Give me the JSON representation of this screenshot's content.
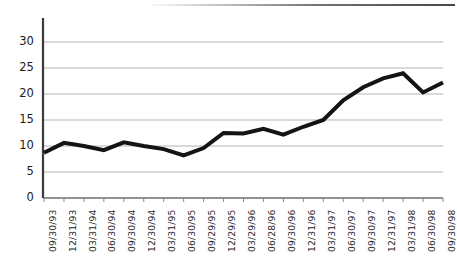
{
  "chart_data": {
    "type": "line",
    "title": "",
    "subtitle": "",
    "xlabel": "",
    "ylabel": "",
    "grid": true,
    "legend": "none",
    "xlim_index": [
      0,
      20
    ],
    "ylim": [
      0,
      33
    ],
    "yticks": [
      0,
      5,
      10,
      15,
      20,
      25,
      30
    ],
    "ytick_labels": [
      "0",
      "5",
      "10",
      "15",
      "20",
      "25",
      "30"
    ],
    "categories": [
      "09/30/93",
      "12/31/93",
      "03/31/94",
      "06/30/94",
      "09/30/94",
      "12/30/94",
      "03/31/95",
      "06/30/95",
      "09/29/95",
      "12/29/95",
      "03/29/96",
      "06/28/96",
      "09/30/96",
      "12/31/96",
      "03/31/97",
      "06/30/97",
      "09/30/97",
      "12/31/97",
      "03/31/98",
      "06/30/98",
      "09/30/98"
    ],
    "values": [
      8.7,
      10.6,
      10.0,
      9.2,
      10.7,
      10.0,
      9.4,
      8.2,
      9.6,
      12.5,
      12.4,
      13.3,
      12.2,
      13.7,
      15.0,
      18.8,
      21.3,
      23.0,
      24.0,
      20.3,
      22.2
    ],
    "series_color": "#141414",
    "gridline_color": "#b4b4b4",
    "axis_color": "#3a3a3a",
    "line_width": 4
  },
  "axes": {
    "y_axis_name": "value-axis",
    "x_axis_name": "date-axis"
  }
}
